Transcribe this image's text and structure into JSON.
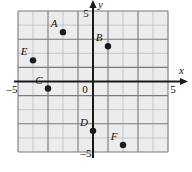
{
  "chart_data": {
    "type": "scatter",
    "title": "",
    "xlabel": "x",
    "ylabel": "y",
    "xlim": [
      -5,
      5
    ],
    "ylim": [
      -5,
      5
    ],
    "grid": true,
    "grid_minor_step": 1,
    "grid_major_step": 2,
    "legend": "none",
    "origin_label": "0",
    "tick_labels": {
      "x_min": "–5",
      "x_max": "5",
      "y_min": "–5",
      "y_max": "5"
    },
    "points": [
      {
        "label": "A",
        "x": -2,
        "y": 3.5,
        "label_dx": -9,
        "label_dy": -5
      },
      {
        "label": "B",
        "x": 1,
        "y": 2.5,
        "label_dx": -9,
        "label_dy": -5
      },
      {
        "label": "E",
        "x": -4,
        "y": 1.5,
        "label_dx": -9,
        "label_dy": -5
      },
      {
        "label": "C",
        "x": -3,
        "y": -0.5,
        "label_dx": -9,
        "label_dy": -5
      },
      {
        "label": "D",
        "x": 0,
        "y": -3.5,
        "label_dx": -9,
        "label_dy": -5
      },
      {
        "label": "F",
        "x": 2,
        "y": -4.5,
        "label_dx": -9,
        "label_dy": -5
      }
    ]
  },
  "colors": {
    "plot_background": "#ececec",
    "grid_minor": "#b9b9b9",
    "grid_major": "#7a7a7a",
    "axis": "#1a1a1a",
    "point": "#1a1a1a",
    "text": "#111111",
    "page_background": "#ffffff"
  }
}
